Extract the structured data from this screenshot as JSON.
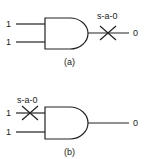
{
  "diagrams": [
    {
      "id": "a",
      "caption": "(a)",
      "inputs": [
        "1",
        "1"
      ],
      "output": "0",
      "fault_label": "s-a-0",
      "fault_location": "output"
    },
    {
      "id": "b",
      "caption": "(b)",
      "inputs": [
        "1",
        "1"
      ],
      "output": "0",
      "fault_label": "s-a-0",
      "fault_location": "input-1"
    }
  ]
}
